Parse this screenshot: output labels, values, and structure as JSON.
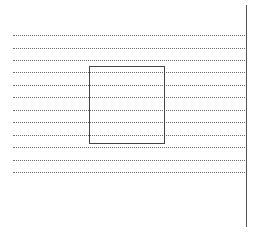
{
  "page": {
    "background": "#ffffff",
    "rules": {
      "count": 12,
      "style": "dotted",
      "color": "#6a6a6a",
      "y_positions": [
        35,
        48,
        60,
        72,
        85,
        97,
        110,
        122,
        135,
        147,
        160,
        172
      ]
    },
    "margin_line": {
      "x": 246,
      "y_start": 5,
      "y_end": 227,
      "color": "#555555"
    },
    "box": {
      "x": 89,
      "y": 66,
      "width": 76,
      "height": 78,
      "color": "#444444"
    }
  }
}
